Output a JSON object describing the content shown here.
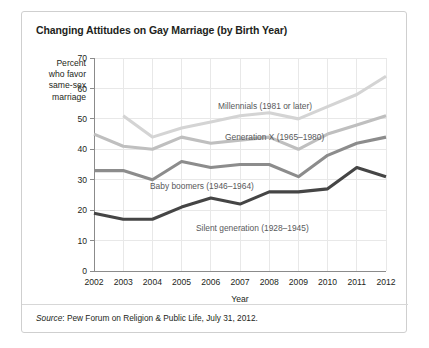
{
  "card": {
    "title": "Changing Attitudes on Gay Marriage (by Birth Year)",
    "source_prefix": "Source",
    "source_text": ": Pew Forum on Religion & Public Life, July 31, 2012."
  },
  "axis": {
    "ylabel_lines": [
      "Percent",
      "who favor",
      "same-sex",
      "marriage"
    ],
    "xlabel": "Year",
    "yticks": [
      "70",
      "60",
      "50",
      "40",
      "30",
      "20",
      "10",
      "0"
    ],
    "xticks": [
      "2002",
      "2003",
      "2004",
      "2005",
      "2006",
      "2007",
      "2008",
      "2009",
      "2010",
      "2011",
      "2012"
    ]
  },
  "colors": {
    "millennials": "#d4d4d4",
    "genx": "#bfbfbf",
    "boomers": "#8c8c8c",
    "silent": "#454545",
    "grid": "#e8e8e8",
    "axis": "#8b8b8b",
    "border": "#cfcfcf",
    "text": "#231f20"
  },
  "chart_data": {
    "type": "line",
    "title": "Changing Attitudes on Gay Marriage (by Birth Year)",
    "xlabel": "Year",
    "ylabel": "Percent who favor same-sex marriage",
    "x": [
      2002,
      2003,
      2004,
      2005,
      2006,
      2007,
      2008,
      2009,
      2010,
      2011,
      2012
    ],
    "xlim": [
      2002,
      2012
    ],
    "ylim": [
      0,
      70
    ],
    "ytick_step": 10,
    "grid": true,
    "legend": "inline-labels",
    "series": [
      {
        "name": "Millennials (1981 or later)",
        "color": "#d4d4d4",
        "label_text": "Millennials (1981 or later)",
        "x": [
          2003,
          2004,
          2005,
          2006,
          2007,
          2008,
          2009,
          2010,
          2011,
          2012
        ],
        "values": [
          51,
          44,
          47,
          49,
          51,
          52,
          50,
          54,
          58,
          64
        ]
      },
      {
        "name": "Generation X (1965–1980)",
        "color": "#bfbfbf",
        "label_text": "Generation X (1965–1980)",
        "x": [
          2002,
          2003,
          2004,
          2005,
          2006,
          2007,
          2008,
          2009,
          2010,
          2011,
          2012
        ],
        "values": [
          45,
          41,
          40,
          44,
          42,
          43,
          44,
          40,
          45,
          48,
          51
        ]
      },
      {
        "name": "Baby boomers (1946–1964)",
        "color": "#8c8c8c",
        "label_text": "Baby boomers (1946–1964)",
        "x": [
          2002,
          2003,
          2004,
          2005,
          2006,
          2007,
          2008,
          2009,
          2010,
          2011,
          2012
        ],
        "values": [
          33,
          33,
          30,
          36,
          34,
          35,
          35,
          31,
          38,
          42,
          44
        ]
      },
      {
        "name": "Silent generation (1928–1945)",
        "color": "#454545",
        "label_text": "Silent generation (1928–1945)",
        "x": [
          2002,
          2003,
          2004,
          2005,
          2006,
          2007,
          2008,
          2009,
          2010,
          2011,
          2012
        ],
        "values": [
          19,
          17,
          17,
          21,
          24,
          22,
          26,
          26,
          27,
          34,
          31
        ]
      }
    ],
    "annotations": [
      {
        "text": "Millennials (1981 or later)",
        "x_px": 196,
        "y_px": 97
      },
      {
        "text": "Generation X (1965–1980)",
        "x_px": 203,
        "y_px": 128
      },
      {
        "text": "Baby boomers (1946–1964)",
        "x_px": 128,
        "y_px": 177
      },
      {
        "text": "Silent generation (1928–1945)",
        "x_px": 174,
        "y_px": 219
      }
    ]
  }
}
